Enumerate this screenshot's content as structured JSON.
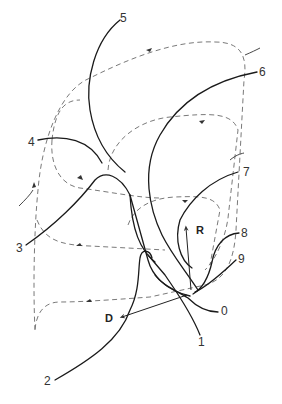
{
  "figure": {
    "type": "trajectory-diagram",
    "stroke_color": "#1a1a1a",
    "dashed_color": "#6a6a6a",
    "curve_labels": [
      "0",
      "1",
      "2",
      "3",
      "4",
      "5",
      "6",
      "7",
      "8",
      "9"
    ],
    "vectors": {
      "r_label": "R",
      "d_label": "D"
    },
    "labels": {
      "l0": "0",
      "l1": "1",
      "l2": "2",
      "l3": "3",
      "l4": "4",
      "l5": "5",
      "l6": "6",
      "l7": "7",
      "l8": "8",
      "l9": "9"
    }
  }
}
